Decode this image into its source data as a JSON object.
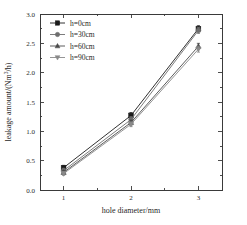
{
  "chart_data": {
    "type": "line",
    "title": "",
    "subtitle": "",
    "xlabel": "hole diameter/mm",
    "ylabel": "leakage amount/(Nm³/h)",
    "ylabel_parts": {
      "pre": "leakage amount/(Nm",
      "sup": "3",
      "post": "/h)"
    },
    "x": [
      1,
      2,
      3
    ],
    "categories": [
      "1",
      "2",
      "3"
    ],
    "xlim": [
      0.65,
      3.35
    ],
    "ylim": [
      0.0,
      3.0
    ],
    "xticks": [
      1,
      2,
      3
    ],
    "xtick_labels": [
      "1",
      "2",
      "3"
    ],
    "yticks": [
      0.0,
      0.5,
      1.0,
      1.5,
      2.0,
      2.5,
      3.0
    ],
    "ytick_labels": [
      "0.0",
      "0.5",
      "1.0",
      "1.5",
      "2.0",
      "2.5",
      "3.0"
    ],
    "y_minor_ticks": [
      0.25,
      0.75,
      1.25,
      1.75,
      2.25,
      2.75
    ],
    "x_minor_ticks": [
      1.5,
      2.5
    ],
    "grid": false,
    "legend_position": "upper left",
    "frame": true,
    "series": [
      {
        "name": "h=0cm",
        "label": "h=0cm",
        "marker": "square",
        "color": "#1b1b1b",
        "values": [
          0.38,
          1.27,
          2.75
        ],
        "errors": [
          0.04,
          0.05,
          0.05
        ]
      },
      {
        "name": "h=30cm",
        "label": "h=30cm",
        "marker": "circle",
        "color": "#6e6e6e",
        "values": [
          0.33,
          1.2,
          2.72
        ],
        "errors": [
          0.04,
          0.05,
          0.05
        ]
      },
      {
        "name": "h=60cm",
        "label": "h=60cm",
        "marker": "triangle-up",
        "color": "#4a4a4a",
        "values": [
          0.3,
          1.15,
          2.45
        ],
        "errors": [
          0.03,
          0.04,
          0.05
        ]
      },
      {
        "name": "h=90cm",
        "label": "h=90cm",
        "marker": "triangle-down",
        "color": "#8a8a8a",
        "values": [
          0.28,
          1.12,
          2.4
        ],
        "errors": [
          0.03,
          0.04,
          0.05
        ]
      }
    ]
  },
  "legend": {
    "items": [
      {
        "label": "h=0cm"
      },
      {
        "label": "h=30cm"
      },
      {
        "label": "h=60cm"
      },
      {
        "label": "h=90cm"
      }
    ]
  },
  "axes": {
    "x_title": "hole diameter/mm",
    "y_title": "leakage amount/(Nm3/h)"
  }
}
